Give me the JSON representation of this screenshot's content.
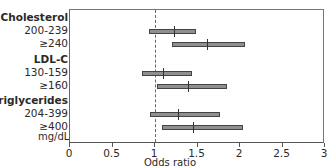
{
  "chart_data": {
    "type": "forest",
    "title": "",
    "xlabel": "Odds ratio",
    "ylabel": "mg/dL",
    "xlim": [
      0,
      3
    ],
    "xticks": [
      0,
      0.5,
      1,
      1.5,
      2,
      2.5,
      3
    ],
    "xtick_labels": [
      "0",
      "0.5",
      "1",
      "1.5",
      "2",
      "2.5",
      "3"
    ],
    "reference_line": 1,
    "grid": false,
    "groups": [
      {
        "name": "Cholesterol",
        "rows": [
          {
            "label": "200-239",
            "or": 1.22,
            "ci_low": 0.93,
            "ci_high": 1.48
          },
          {
            "label": "≥240",
            "or": 1.61,
            "ci_low": 1.2,
            "ci_high": 2.06
          }
        ]
      },
      {
        "name": "LDL-C",
        "rows": [
          {
            "label": "130-159",
            "or": 1.09,
            "ci_low": 0.85,
            "ci_high": 1.44
          },
          {
            "label": "≥160",
            "or": 1.39,
            "ci_low": 1.02,
            "ci_high": 1.85
          }
        ]
      },
      {
        "name": "Triglycerides",
        "rows": [
          {
            "label": "204-399",
            "or": 1.27,
            "ci_low": 0.94,
            "ci_high": 1.76
          },
          {
            "label": "≥400",
            "or": 1.45,
            "ci_low": 1.08,
            "ci_high": 2.04
          }
        ]
      }
    ]
  },
  "colors": {
    "bar_fill": "#8f8f8f",
    "bar_edge": "#444444",
    "axis": "#555555"
  }
}
